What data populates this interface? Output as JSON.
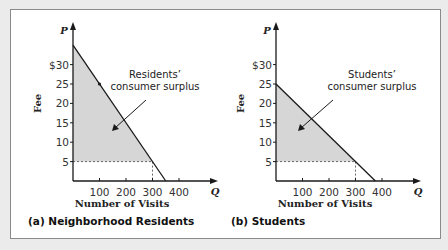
{
  "chart_data": [
    {
      "type": "line",
      "panel_label": "(a) Neighborhood Residents",
      "xlabel": "Number of Visits",
      "ylabel": "Fee",
      "x_axis_symbol": "Q",
      "y_axis_symbol": "P",
      "x_ticks": [
        100,
        200,
        300,
        400
      ],
      "x_tick_labels": [
        "100",
        "200",
        "300",
        "400"
      ],
      "y_ticks": [
        5,
        10,
        15,
        20,
        25,
        30
      ],
      "y_tick_labels": [
        "5",
        "10",
        "15",
        "20",
        "25",
        "$30"
      ],
      "xlim": [
        0,
        440
      ],
      "ylim": [
        0,
        38
      ],
      "demand": {
        "x": [
          0,
          350
        ],
        "y": [
          35,
          0
        ]
      },
      "price": 5,
      "quantity_at_price": 300,
      "marked_point": {
        "x": 100,
        "y": 25
      },
      "annotation": [
        "Residents’",
        "consumer surplus"
      ],
      "shaded_region": "consumer surplus",
      "grid": false
    },
    {
      "type": "line",
      "panel_label": "(b) Students",
      "xlabel": "Number of Visits",
      "ylabel": "Fee",
      "x_axis_symbol": "Q",
      "y_axis_symbol": "P",
      "x_ticks": [
        100,
        200,
        300,
        400
      ],
      "x_tick_labels": [
        "100",
        "200",
        "300",
        "400"
      ],
      "y_ticks": [
        5,
        10,
        15,
        20,
        25,
        30
      ],
      "y_tick_labels": [
        "5",
        "10",
        "15",
        "20",
        "25",
        "$30"
      ],
      "xlim": [
        0,
        440
      ],
      "ylim": [
        0,
        38
      ],
      "demand": {
        "x": [
          0,
          375
        ],
        "y": [
          25,
          0
        ]
      },
      "price": 5,
      "quantity_at_price": 300,
      "annotation": [
        "Students’",
        "consumer surplus"
      ],
      "shaded_region": "consumer surplus",
      "grid": false
    }
  ],
  "colors": {
    "shade": "#d6d6d6",
    "line": "#1a1a1a",
    "axis": "#1a1a1a"
  }
}
